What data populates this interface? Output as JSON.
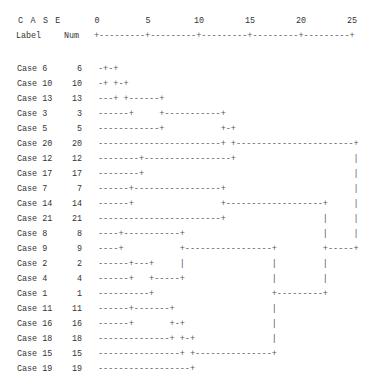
{
  "header": {
    "case_title": "C A S E",
    "label_heading": "Label",
    "num_heading": "Num"
  },
  "axis": {
    "ticks": [
      "0",
      "5",
      "10",
      "15",
      "20",
      "25"
    ],
    "line": "+---------+---------+---------+---------+---------+"
  },
  "rows": [
    {
      "label": "Case 6",
      "num": "6",
      "tree": "-+-+"
    },
    {
      "label": "Case 10",
      "num": "10",
      "tree": "-+ +-+"
    },
    {
      "label": "Case 13",
      "num": "13",
      "tree": "---+ +------+"
    },
    {
      "label": "Case 3",
      "num": "3",
      "tree": "------+     +-----------+"
    },
    {
      "label": "Case 5",
      "num": "5",
      "tree": "------------+           +-+"
    },
    {
      "label": "Case 20",
      "num": "20",
      "tree": "------------------------+ +-----------------------+"
    },
    {
      "label": "Case 12",
      "num": "12",
      "tree": "--------+-----------------+                       |"
    },
    {
      "label": "Case 17",
      "num": "17",
      "tree": "--------+                                         |"
    },
    {
      "label": "Case 7",
      "num": "7",
      "tree": "------+-----------------+                         |"
    },
    {
      "label": "Case 14",
      "num": "14",
      "tree": "------+                 +-------------------+     |"
    },
    {
      "label": "Case 21",
      "num": "21",
      "tree": "------------------------+                   |     |"
    },
    {
      "label": "Case 8",
      "num": "8",
      "tree": "----+-----------+                           |     |"
    },
    {
      "label": "Case 9",
      "num": "9",
      "tree": "----+           +-----------------+         +-----+"
    },
    {
      "label": "Case 2",
      "num": "2",
      "tree": "------+---+     |                 |         |"
    },
    {
      "label": "Case 4",
      "num": "4",
      "tree": "------+   +-----+                 |         |"
    },
    {
      "label": "Case 1",
      "num": "1",
      "tree": "----------+                       +---------+"
    },
    {
      "label": "Case 11",
      "num": "11",
      "tree": "------+-------+                   |"
    },
    {
      "label": "Case 16",
      "num": "16",
      "tree": "------+       +-+                 |"
    },
    {
      "label": "Case 18",
      "num": "18",
      "tree": "--------------+ +-+               |"
    },
    {
      "label": "Case 15",
      "num": "15",
      "tree": "----------------+ +---------------+"
    },
    {
      "label": "Case 19",
      "num": "19",
      "tree": "------------------+"
    }
  ],
  "chart_data": {
    "type": "dendrogram",
    "title": "",
    "xlabel": "Rescaled Distance Cluster Combine",
    "x_ticks": [
      0,
      5,
      10,
      15,
      20,
      25
    ],
    "xlim": [
      0,
      25
    ],
    "leaf_order": [
      6,
      10,
      13,
      3,
      5,
      20,
      12,
      17,
      7,
      14,
      21,
      8,
      9,
      2,
      4,
      1,
      11,
      16,
      18,
      15,
      19
    ],
    "merges": [
      {
        "clusters": [
          "6",
          "10"
        ],
        "distance": 1.5
      },
      {
        "clusters": [
          "6-10",
          "13"
        ],
        "distance": 2.5
      },
      {
        "clusters": [
          "2",
          "4"
        ],
        "distance": 3
      },
      {
        "clusters": [
          "8",
          "9"
        ],
        "distance": 2
      },
      {
        "clusters": [
          "7",
          "14"
        ],
        "distance": 3
      },
      {
        "clusters": [
          "11",
          "16"
        ],
        "distance": 7
      },
      {
        "clusters": [
          "6-10-13",
          "3"
        ],
        "distance": 6
      },
      {
        "clusters": [
          "12",
          "17"
        ],
        "distance": 4
      },
      {
        "clusters": [
          "2-4",
          "1"
        ],
        "distance": 5
      },
      {
        "clusters": [
          "11-16",
          "18"
        ],
        "distance": 8
      },
      {
        "clusters": [
          "8-9",
          "2-4-1"
        ],
        "distance": 8
      },
      {
        "clusters": [
          "11-16-18",
          "15"
        ],
        "distance": 9
      },
      {
        "clusters": [
          "6-10-13-3",
          "5"
        ],
        "distance": 12
      },
      {
        "clusters": [
          "7-14",
          "21"
        ],
        "distance": 12
      },
      {
        "clusters": [
          "6-10-13-3-5",
          "20"
        ],
        "distance": 13
      },
      {
        "clusters": [
          "12-17",
          "6-10-13-3-5-20"
        ],
        "distance": 13
      },
      {
        "clusters": [
          "8-9-2-4-1",
          "11-16-18-15-19"
        ],
        "distance": 17
      },
      {
        "clusters": [
          "11-16-18-15",
          "19"
        ],
        "distance": 9
      },
      {
        "clusters": [
          "7-14-21",
          "8-9-2-4-1-11-16-18-15-19"
        ],
        "distance": 22
      },
      {
        "clusters": [
          "all-upper",
          "all-lower"
        ],
        "distance": 25
      }
    ]
  }
}
